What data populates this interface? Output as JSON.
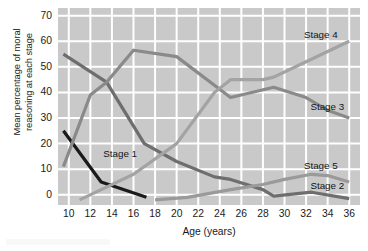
{
  "chart_data": {
    "type": "line",
    "title": "",
    "xlabel": "Age (years)",
    "ylabel": "Mean percentage of moral reasoning at each stage",
    "ylabel_line1": "Mean percentage of moral",
    "ylabel_line2": "reasoning at each stage",
    "xlim": [
      9,
      37
    ],
    "ylim": [
      -4,
      73
    ],
    "yticks": [
      0,
      10,
      20,
      30,
      40,
      50,
      60,
      70
    ],
    "xticks": [
      10,
      12,
      14,
      16,
      18,
      20,
      22,
      24,
      26,
      28,
      30,
      32,
      34,
      36
    ],
    "grid": true,
    "grid_color": "#ffffff",
    "plot_background": "#c9c9c9",
    "legend_position": "inline-labels",
    "series": [
      {
        "name": "Stage 1",
        "color": "#1a1a1a",
        "label_x": 13.2,
        "label_y": 15.5,
        "x": [
          9.5,
          13,
          17.2
        ],
        "values": [
          25,
          5,
          -1
        ]
      },
      {
        "name": "Stage 2",
        "color": "#6e6e6e",
        "label_x": 32.4,
        "label_y": 3.2,
        "x": [
          9.5,
          13.5,
          17,
          20,
          23.5,
          25,
          28,
          29,
          32.5,
          36
        ],
        "values": [
          55,
          44,
          20,
          13,
          7,
          6,
          2,
          -0.5,
          1,
          -1.5
        ]
      },
      {
        "name": "Stage 3",
        "color": "#8a8a8a",
        "label_x": 32.4,
        "label_y": 34,
        "x": [
          9.5,
          12,
          13.5,
          16,
          20,
          25,
          29,
          32,
          34,
          36
        ],
        "values": [
          11,
          39,
          44,
          56.5,
          54,
          38,
          42,
          38,
          33,
          30
        ]
      },
      {
        "name": "Stage 4",
        "color": "#a3a3a3",
        "label_x": 31.8,
        "label_y": 62,
        "x": [
          11,
          13.5,
          16,
          20,
          23.5,
          25,
          28,
          29,
          32,
          36
        ],
        "values": [
          -2,
          3,
          8,
          20,
          40,
          45,
          45,
          46,
          52,
          60
        ]
      },
      {
        "name": "Stage 5",
        "color": "#9a9a9a",
        "label_x": 31.8,
        "label_y": 11,
        "x": [
          18,
          21,
          25,
          28,
          30,
          32.5,
          34,
          36
        ],
        "values": [
          -2,
          -1,
          2,
          4,
          6,
          8,
          7.5,
          5
        ]
      }
    ]
  }
}
